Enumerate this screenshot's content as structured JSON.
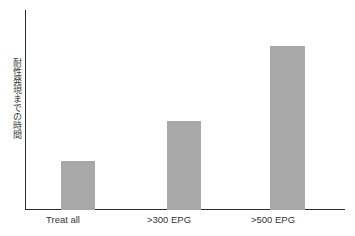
{
  "chart_data": {
    "type": "bar",
    "title": "",
    "subtitle": "",
    "xlabel": "",
    "ylabel": "耐性発現までの時間",
    "categories": [
      "Treat all",
      ">300 EPG",
      ">500 EPG"
    ],
    "values": [
      30,
      54,
      100
    ],
    "value_unit": "relative bar height (% of tallest bar)",
    "ylim": [
      0,
      122
    ],
    "grid": false,
    "legend": null,
    "annotations": [],
    "axis_ticks_y": [],
    "bar_color": "#a8a8a8",
    "axis_color": "#2b2b2b",
    "label_color": "#333333"
  },
  "chart": {
    "y_axis_title": "耐性発現までの時間",
    "bars": [
      {
        "label": "Treat all",
        "value": 30,
        "left_px": 36,
        "width_px": 34,
        "height_px": 50
      },
      {
        "label": ">300 EPG",
        "value": 54,
        "left_px": 142,
        "width_px": 34,
        "height_px": 88
      },
      {
        "label": ">500 EPG",
        "value": 100,
        "left_px": 245,
        "width_px": 35,
        "height_px": 164
      }
    ],
    "category_labels": [
      {
        "text": "Treat all",
        "left_px": 33,
        "width_px": 60
      },
      {
        "text": ">300 EPG",
        "left_px": 139,
        "width_px": 60
      },
      {
        "text": ">500 EPG",
        "left_px": 242,
        "width_px": 62
      }
    ]
  }
}
